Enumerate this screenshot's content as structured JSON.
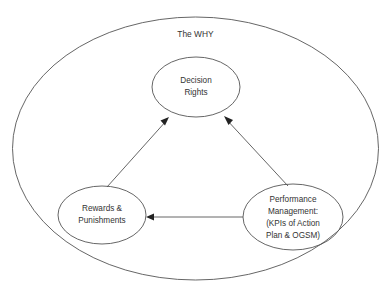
{
  "diagram": {
    "title": "The WHY",
    "container": {
      "label": "The WHY",
      "shape": "ellipse",
      "cx": 195.5,
      "cy": 148.5,
      "rx": 183,
      "ry": 131.5,
      "stroke": "#555555",
      "fill": "none"
    },
    "title_position": {
      "x": 195.5,
      "y": 35
    },
    "nodes": [
      {
        "id": "decision-rights",
        "name": "Decision Rights",
        "lines": [
          "Decision",
          "Rights"
        ],
        "shape": "ellipse",
        "cx": 196,
        "cy": 87,
        "rx": 44,
        "ry": 30,
        "stroke": "#555555",
        "fill": "none"
      },
      {
        "id": "rewards-punishments",
        "name": "Rewards & Punishments",
        "lines": [
          "Rewards &",
          "Punishments"
        ],
        "shape": "ellipse",
        "cx": 102,
        "cy": 215,
        "rx": 44,
        "ry": 29,
        "stroke": "#555555",
        "fill": "none"
      },
      {
        "id": "performance-management",
        "name": "Performance Management",
        "lines": [
          "Performance",
          "Management:",
          "(KPIs of Action",
          "Plan & OGSM)"
        ],
        "shape": "ellipse",
        "cx": 293,
        "cy": 217,
        "rx": 50,
        "ry": 33,
        "stroke": "#555555",
        "fill": "none"
      }
    ],
    "arrows": [
      {
        "id": "rewards-to-decision",
        "from": "rewards-punishments",
        "to": "decision-rights",
        "x1": 107,
        "y1": 187,
        "x2": 169,
        "y2": 118,
        "direction": "to-decision-rights"
      },
      {
        "id": "performance-to-decision",
        "from": "performance-management",
        "to": "decision-rights",
        "x1": 288,
        "y1": 186,
        "x2": 224,
        "y2": 117,
        "direction": "to-decision-rights"
      },
      {
        "id": "performance-to-rewards",
        "from": "performance-management",
        "to": "rewards-punishments",
        "x1": 243,
        "y1": 217,
        "x2": 147,
        "y2": 217,
        "direction": "to-rewards"
      }
    ],
    "colors": {
      "background": "#ffffff",
      "stroke": "#555555",
      "text": "#333333",
      "arrowhead": "#222222"
    }
  }
}
